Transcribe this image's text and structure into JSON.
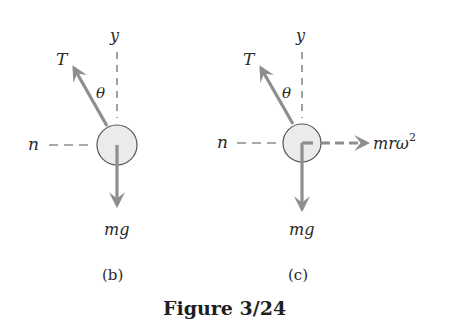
{
  "caption": "Figure 3/24",
  "colors": {
    "arrow": "#8e8e8e",
    "circle_fill": "#ebebeb",
    "circle_stroke": "#555555",
    "axis": "#555555",
    "text": "#2a2a2a"
  },
  "panels": [
    {
      "id": "b",
      "sublabel": "(b)",
      "labels": {
        "tension": "T",
        "angle": "θ",
        "y_axis": "y",
        "n_axis": "n",
        "weight": "mg"
      }
    },
    {
      "id": "c",
      "sublabel": "(c)",
      "labels": {
        "tension": "T",
        "angle": "θ",
        "y_axis": "y",
        "n_axis": "n",
        "weight": "mg",
        "inertial_force_base": "mrω",
        "inertial_force_exp": "2"
      }
    }
  ]
}
